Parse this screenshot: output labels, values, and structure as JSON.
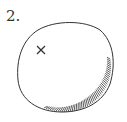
{
  "figure": {
    "label": "2.",
    "marker_symbol": "×",
    "colors": {
      "ink": "#333333",
      "background": "#ffffff"
    }
  }
}
